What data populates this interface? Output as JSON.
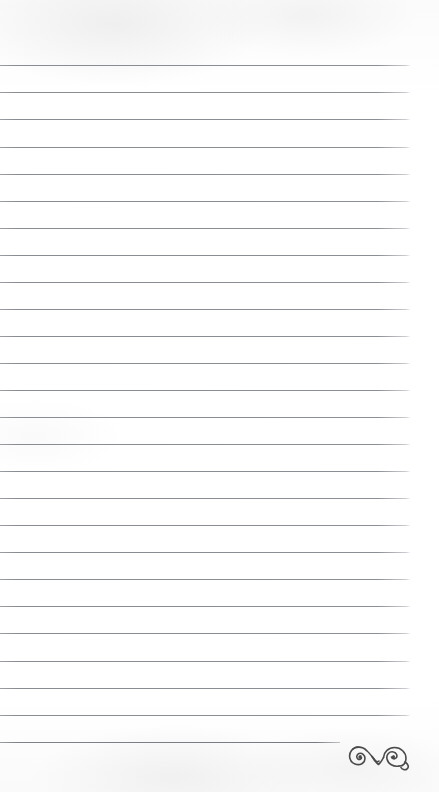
{
  "document": {
    "type": "lined-notepad-page",
    "title": "Blank Lined Notepad Page",
    "page_width": 439,
    "page_height": 792,
    "background_color": "#fefefe",
    "content_text": ""
  },
  "rules": {
    "line_color": "#8a8c93",
    "line_thickness_px": 1,
    "line_spacing_px": 27.15,
    "first_line_y": 65,
    "line_left_x": 0,
    "line_right_x": 410,
    "last_line_right_x": 340,
    "count": 26,
    "y_positions": [
      65,
      92,
      119,
      147,
      174,
      201,
      228,
      255,
      282,
      309,
      336,
      363,
      390,
      417,
      444,
      471,
      498,
      525,
      552,
      579,
      606,
      633,
      661,
      688,
      715,
      742
    ]
  },
  "ornament": {
    "name": "decorative-swirl-flourish",
    "color": "#4a4a4c",
    "x": 346,
    "y": 742,
    "width": 64,
    "height": 30,
    "description": "double-scroll calligraphic flourish"
  }
}
